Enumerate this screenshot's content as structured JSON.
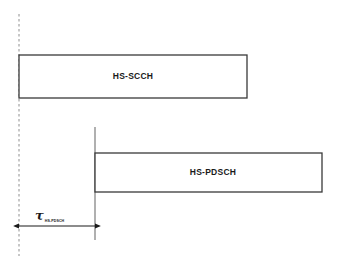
{
  "figure": {
    "background_color": "#ffffff",
    "line_color": "#333333",
    "dashed_line_color": "#999999",
    "box_fill_color": "#ffffff",
    "text_color": "#1a1a1a"
  },
  "reference_line": {
    "name": "timing reference",
    "style": "dashed",
    "x": 19,
    "y_top": 14,
    "y_bottom": 256
  },
  "pdsch_start_line": {
    "name": "HS-PDSCH start marker",
    "style": "solid",
    "x": 95,
    "y_top": 127,
    "y_bottom": 240
  },
  "channels": [
    {
      "id": "hs-scch",
      "label": "HS-SCCH",
      "x": 19,
      "y": 55,
      "width": 228,
      "height": 43,
      "label_x": 133,
      "label_y": 76
    },
    {
      "id": "hs-pdsch",
      "label": "HS-PDSCH",
      "x": 95,
      "y": 153,
      "width": 227,
      "height": 39,
      "label_x": 213,
      "label_y": 172
    }
  ],
  "offset_measure": {
    "symbol": "τ",
    "subscript": "HS-PDSCH",
    "arrow_y": 226,
    "arrow_x_start": 19,
    "arrow_x_end": 95,
    "label_x": 35,
    "label_y": 206
  }
}
